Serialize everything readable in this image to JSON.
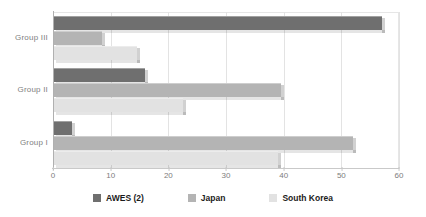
{
  "chart_data": {
    "type": "bar",
    "orientation": "horizontal",
    "title": "",
    "xlabel": "",
    "ylabel": "",
    "categories": [
      "Group III",
      "Group II",
      "Group I"
    ],
    "series": [
      {
        "name": "AWES (2)",
        "color": "#6f6f6f",
        "values": [
          57.0,
          16.0,
          3.3
        ]
      },
      {
        "name": "Japan",
        "color": "#b4b4b4",
        "values": [
          8.5,
          39.5,
          52.0
        ]
      },
      {
        "name": "South Korea",
        "color": "#e2e2e2",
        "values": [
          14.5,
          22.5,
          39.0
        ]
      }
    ],
    "xlim": [
      0,
      60
    ],
    "xticks": [
      0,
      10,
      20,
      30,
      40,
      50,
      60
    ],
    "xtick_labels": [
      "0",
      "10",
      "20",
      "30",
      "40",
      "50",
      "60"
    ],
    "grid": "vertical",
    "legend_position": "bottom"
  },
  "legend": {
    "items": [
      {
        "label": "AWES (2)",
        "color": "#6f6f6f"
      },
      {
        "label": "Japan",
        "color": "#b4b4b4"
      },
      {
        "label": "South Korea",
        "color": "#e2e2e2"
      }
    ]
  },
  "axis": {
    "x_tick_labels": [
      "0",
      "10",
      "20",
      "30",
      "40",
      "50",
      "60"
    ],
    "y_tick_labels": [
      "Group III",
      "Group II",
      "Group I"
    ]
  }
}
